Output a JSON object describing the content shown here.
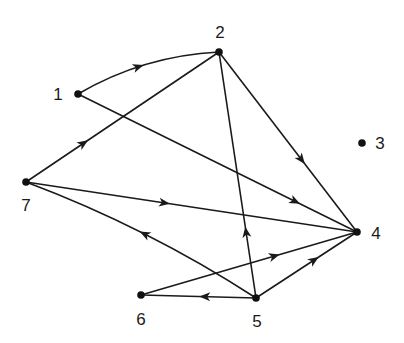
{
  "diagram": {
    "type": "directed-graph",
    "colors": {
      "line": "#1a1a1a",
      "node": "#111111",
      "background": "#ffffff"
    },
    "nodes": [
      {
        "id": "1",
        "label": "1",
        "x": 78,
        "y": 94,
        "lx": 58,
        "ly": 100
      },
      {
        "id": "2",
        "label": "2",
        "x": 219,
        "y": 52,
        "lx": 220,
        "ly": 38
      },
      {
        "id": "3",
        "label": "3",
        "x": 362,
        "y": 143,
        "lx": 380,
        "ly": 149
      },
      {
        "id": "4",
        "label": "4",
        "x": 357,
        "y": 232,
        "lx": 376,
        "ly": 239
      },
      {
        "id": "5",
        "label": "5",
        "x": 256,
        "y": 298,
        "lx": 257,
        "ly": 327
      },
      {
        "id": "6",
        "label": "6",
        "x": 141,
        "y": 295,
        "lx": 141,
        "ly": 325
      },
      {
        "id": "7",
        "label": "7",
        "x": 26,
        "y": 182,
        "lx": 26,
        "ly": 211
      }
    ],
    "edges": [
      {
        "from": "1",
        "to": "2",
        "curve": -18,
        "arrow_t": 0.45
      },
      {
        "from": "1",
        "to": "4",
        "curve": 0,
        "arrow_t": 0.78
      },
      {
        "from": "7",
        "to": "2",
        "curve": 0,
        "arrow_t": 0.3
      },
      {
        "from": "2",
        "to": "4",
        "curve": 0,
        "arrow_t": 0.6
      },
      {
        "from": "5",
        "to": "2",
        "curve": 0,
        "arrow_t": 0.27
      },
      {
        "from": "7",
        "to": "4",
        "curve": 0,
        "arrow_t": 0.42
      },
      {
        "from": "5",
        "to": "7",
        "curve": 14,
        "arrow_t": 0.5
      },
      {
        "from": "6",
        "to": "4",
        "curve": 0,
        "arrow_t": 0.62
      },
      {
        "from": "5",
        "to": "6",
        "curve": 0,
        "arrow_t": 0.45
      },
      {
        "from": "5",
        "to": "4",
        "curve": 0,
        "arrow_t": 0.58
      }
    ]
  }
}
